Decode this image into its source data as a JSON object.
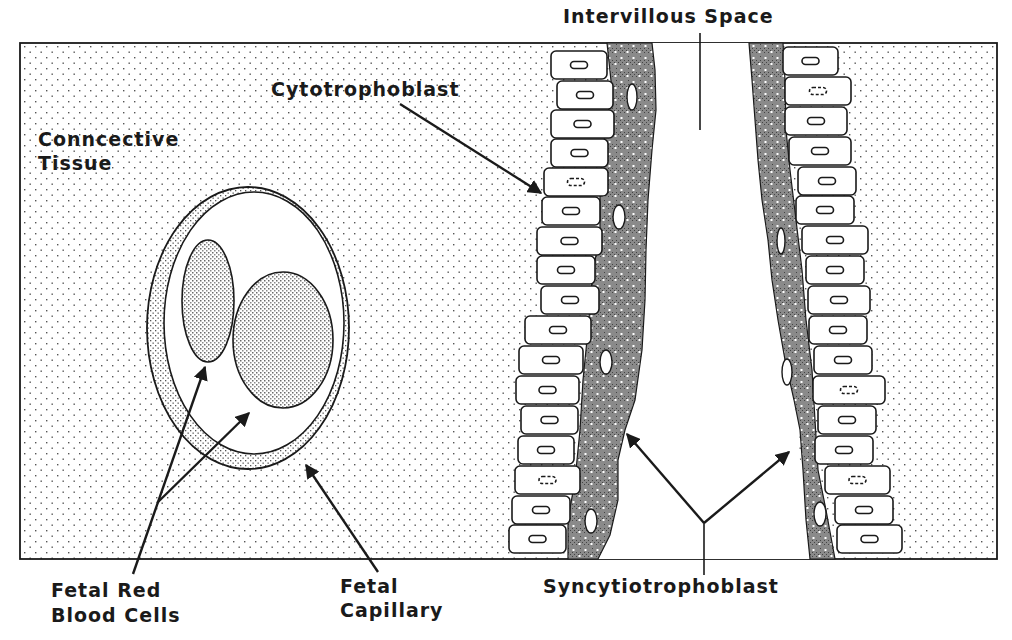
{
  "diagram": {
    "labels": {
      "intervillous_space": "Intervillous Space",
      "cytotrophoblast": "Cytotrophoblast",
      "connective_tissue_line1": "Conncective",
      "connective_tissue_line2": "Tissue",
      "fetal_rbc_line1": "Fetal Red",
      "fetal_rbc_line2": "Blood Cells",
      "fetal_capillary_line1": "Fetal",
      "fetal_capillary_line2": "Capillary",
      "syncytiotrophoblast": "Syncytiotrophoblast"
    },
    "colors": {
      "ink": "#1a1a1a",
      "background": "#ffffff",
      "stipple_dot": "#555555",
      "syncytium_fill": "#8a8a8a"
    },
    "frame": {
      "x": 20,
      "y": 43,
      "width": 977,
      "height": 516
    },
    "left_cells": [
      {
        "x": 551,
        "y": 51,
        "w": 56,
        "h": 28,
        "nucleus": "solid"
      },
      {
        "x": 557,
        "y": 81,
        "w": 56,
        "h": 28,
        "nucleus": "solid"
      },
      {
        "x": 551,
        "y": 110,
        "w": 63,
        "h": 28,
        "nucleus": "solid"
      },
      {
        "x": 551,
        "y": 139,
        "w": 57,
        "h": 28,
        "nucleus": "solid"
      },
      {
        "x": 544,
        "y": 168,
        "w": 64,
        "h": 28,
        "nucleus": "dashed"
      },
      {
        "x": 542,
        "y": 197,
        "w": 58,
        "h": 28,
        "nucleus": "solid"
      },
      {
        "x": 537,
        "y": 227,
        "w": 65,
        "h": 28,
        "nucleus": "solid"
      },
      {
        "x": 537,
        "y": 256,
        "w": 58,
        "h": 28,
        "nucleus": "solid"
      },
      {
        "x": 541,
        "y": 286,
        "w": 58,
        "h": 28,
        "nucleus": "solid"
      },
      {
        "x": 525,
        "y": 316,
        "w": 66,
        "h": 28,
        "nucleus": "solid"
      },
      {
        "x": 519,
        "y": 346,
        "w": 64,
        "h": 28,
        "nucleus": "solid"
      },
      {
        "x": 516,
        "y": 376,
        "w": 63,
        "h": 28,
        "nucleus": "solid"
      },
      {
        "x": 521,
        "y": 406,
        "w": 57,
        "h": 28,
        "nucleus": "solid"
      },
      {
        "x": 518,
        "y": 436,
        "w": 56,
        "h": 28,
        "nucleus": "solid"
      },
      {
        "x": 515,
        "y": 466,
        "w": 65,
        "h": 28,
        "nucleus": "dashed"
      },
      {
        "x": 512,
        "y": 496,
        "w": 58,
        "h": 28,
        "nucleus": "solid"
      },
      {
        "x": 509,
        "y": 525,
        "w": 57,
        "h": 28,
        "nucleus": "solid"
      }
    ],
    "right_cells": [
      {
        "x": 783,
        "y": 47,
        "w": 55,
        "h": 28,
        "nucleus": "solid"
      },
      {
        "x": 785,
        "y": 77,
        "w": 66,
        "h": 28,
        "nucleus": "dashed"
      },
      {
        "x": 785,
        "y": 107,
        "w": 62,
        "h": 28,
        "nucleus": "solid"
      },
      {
        "x": 789,
        "y": 137,
        "w": 62,
        "h": 28,
        "nucleus": "solid"
      },
      {
        "x": 798,
        "y": 167,
        "w": 58,
        "h": 28,
        "nucleus": "solid"
      },
      {
        "x": 796,
        "y": 196,
        "w": 58,
        "h": 28,
        "nucleus": "solid"
      },
      {
        "x": 802,
        "y": 226,
        "w": 66,
        "h": 28,
        "nucleus": "solid"
      },
      {
        "x": 806,
        "y": 256,
        "w": 58,
        "h": 28,
        "nucleus": "solid"
      },
      {
        "x": 808,
        "y": 286,
        "w": 62,
        "h": 28,
        "nucleus": "solid"
      },
      {
        "x": 809,
        "y": 316,
        "w": 58,
        "h": 28,
        "nucleus": "solid"
      },
      {
        "x": 814,
        "y": 346,
        "w": 58,
        "h": 28,
        "nucleus": "solid"
      },
      {
        "x": 813,
        "y": 376,
        "w": 72,
        "h": 28,
        "nucleus": "dashed"
      },
      {
        "x": 818,
        "y": 406,
        "w": 58,
        "h": 28,
        "nucleus": "solid"
      },
      {
        "x": 815,
        "y": 436,
        "w": 58,
        "h": 28,
        "nucleus": "solid"
      },
      {
        "x": 825,
        "y": 466,
        "w": 65,
        "h": 28,
        "nucleus": "dashed"
      },
      {
        "x": 835,
        "y": 496,
        "w": 58,
        "h": 28,
        "nucleus": "solid"
      },
      {
        "x": 837,
        "y": 525,
        "w": 65,
        "h": 28,
        "nucleus": "solid"
      }
    ]
  }
}
